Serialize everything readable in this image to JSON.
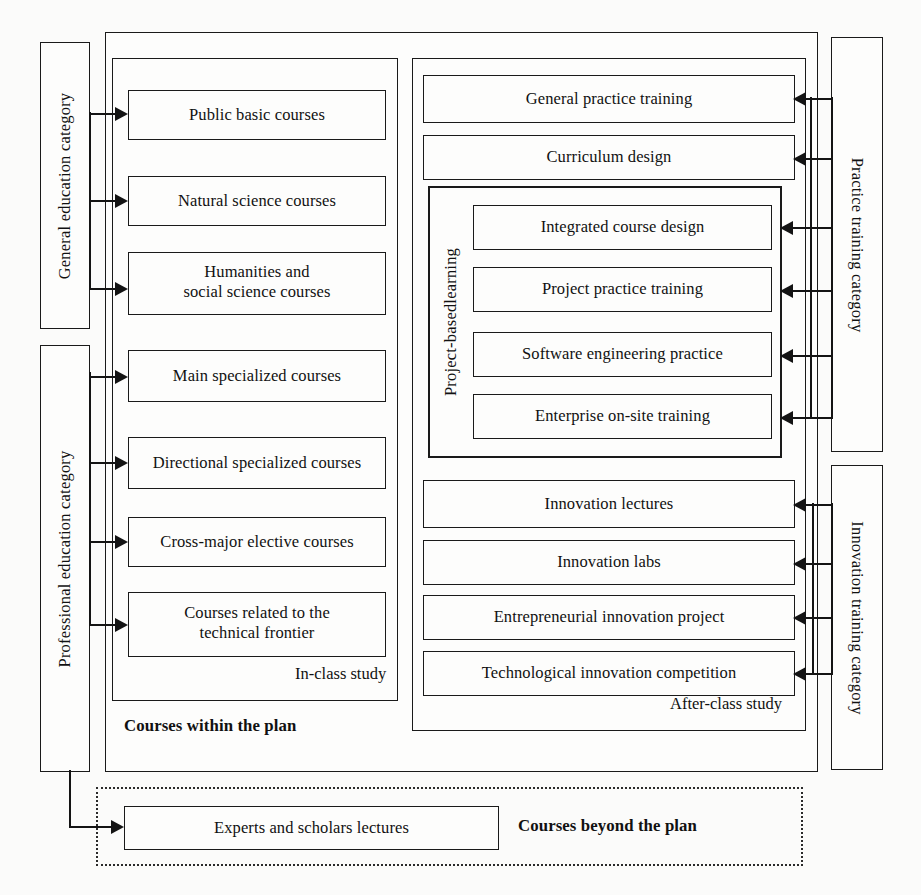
{
  "diagram": {
    "left_categories": [
      {
        "id": "general-education",
        "label": "General education category"
      },
      {
        "id": "professional-education",
        "label": "Professional education category"
      }
    ],
    "right_categories": [
      {
        "id": "practice-training",
        "label": "Practice training category"
      },
      {
        "id": "innovation-training",
        "label": "Innovation training category"
      }
    ],
    "groups": {
      "within_plan": {
        "caption": "Courses within the plan"
      },
      "beyond_plan": {
        "caption": "Courses beyond the plan"
      },
      "in_class": {
        "caption": "In-class study"
      },
      "after_class": {
        "caption": "After-class study"
      },
      "project_based": {
        "label": "Project-basedlearning"
      }
    },
    "in_class_courses": [
      {
        "id": "public-basic-courses",
        "label": "Public basic courses"
      },
      {
        "id": "natural-science-courses",
        "label": "Natural science courses"
      },
      {
        "id": "humanities-social-science-courses",
        "line1": "Humanities and",
        "line2": "social science courses"
      },
      {
        "id": "main-specialized-courses",
        "label": "Main specialized courses"
      },
      {
        "id": "directional-specialized-courses",
        "label": "Directional specialized courses"
      },
      {
        "id": "cross-major-elective-courses",
        "label": "Cross-major elective courses"
      },
      {
        "id": "courses-technical-frontier",
        "line1": "Courses related to the",
        "line2": "technical frontier"
      }
    ],
    "practice_courses": [
      {
        "id": "general-practice-training",
        "label": "General practice training"
      },
      {
        "id": "curriculum-design",
        "label": "Curriculum design"
      }
    ],
    "project_based_courses": [
      {
        "id": "integrated-course-design",
        "label": "Integrated course design"
      },
      {
        "id": "project-practice-training",
        "label": "Project practice training"
      },
      {
        "id": "software-engineering-practice",
        "label": "Software engineering practice"
      },
      {
        "id": "enterprise-on-site-training",
        "label": "Enterprise on-site training"
      }
    ],
    "innovation_courses": [
      {
        "id": "innovation-lectures",
        "label": "Innovation lectures"
      },
      {
        "id": "innovation-labs",
        "label": "Innovation labs"
      },
      {
        "id": "entrepreneurial-innovation-project",
        "label": "Entrepreneurial innovation project"
      },
      {
        "id": "technological-innovation-competition",
        "label": "Technological innovation competition"
      }
    ],
    "beyond_plan_courses": [
      {
        "id": "experts-scholars-lectures",
        "label": "Experts and scholars lectures"
      }
    ],
    "colors": {
      "line": "#141414",
      "box_fill": "#fdfdfc",
      "page_background": "#fbfbfa"
    }
  }
}
